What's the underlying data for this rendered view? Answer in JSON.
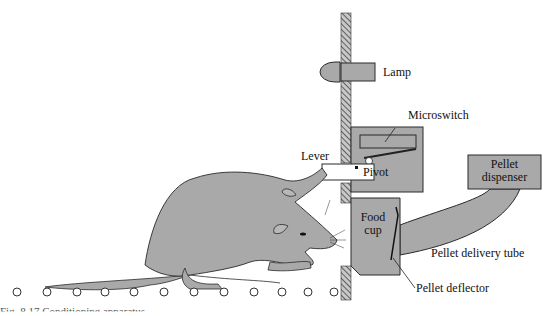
{
  "figure": {
    "caption_partial": "Fig. 8.17  Conditioning apparatus"
  },
  "labels": {
    "lamp": "Lamp",
    "microswitch": "Microswitch",
    "lever": "Lever",
    "pivot": "Pivot",
    "pellet_dispenser_1": "Pellet",
    "pellet_dispenser_2": "dispenser",
    "food_cup_1": "Food",
    "food_cup_2": "cup",
    "pellet_delivery_tube": "Pellet delivery tube",
    "pellet_deflector": "Pellet deflector"
  },
  "colors": {
    "fill_gray": "#a9a9a9",
    "outline": "#2a2a2a",
    "hatch": "#555555",
    "background": "#ffffff"
  },
  "floor_grid_rods": 12
}
